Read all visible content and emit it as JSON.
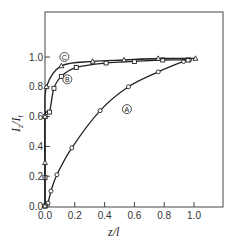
{
  "chart_data": {
    "type": "line",
    "title": "",
    "xlabel": "z/l",
    "ylabel": "I_z/I_t",
    "xlim": [
      0.0,
      1.2
    ],
    "ylim": [
      0.0,
      1.25
    ],
    "x_ticks": [
      "0.0",
      "0.2",
      "0.4",
      "0.6",
      "0.8",
      "1.0"
    ],
    "y_ticks": [
      "0.0",
      "0.2",
      "0.4",
      "0.6",
      "0.8",
      "1.0"
    ],
    "grid": false,
    "legend": "inline circled labels",
    "series": [
      {
        "name": "A",
        "marker": "circle",
        "points": [
          [
            0.0,
            0.0
          ],
          [
            0.02,
            0.02
          ],
          [
            0.04,
            0.1
          ],
          [
            0.08,
            0.21
          ],
          [
            0.18,
            0.39
          ],
          [
            0.37,
            0.64
          ],
          [
            0.56,
            0.8
          ],
          [
            0.76,
            0.9
          ],
          [
            0.93,
            0.97
          ],
          [
            0.97,
            0.98
          ]
        ]
      },
      {
        "name": "B",
        "marker": "square",
        "points": [
          [
            0.0,
            0.0
          ],
          [
            0.0,
            0.19
          ],
          [
            0.0,
            0.6
          ],
          [
            0.03,
            0.63
          ],
          [
            0.06,
            0.79
          ],
          [
            0.11,
            0.87
          ],
          [
            0.21,
            0.93
          ],
          [
            0.41,
            0.96
          ],
          [
            0.6,
            0.97
          ],
          [
            0.79,
            0.98
          ],
          [
            0.96,
            0.98
          ]
        ]
      },
      {
        "name": "C",
        "marker": "triangle",
        "points": [
          [
            0.0,
            0.0
          ],
          [
            0.0,
            0.29
          ],
          [
            0.0,
            0.6
          ],
          [
            0.01,
            0.8
          ],
          [
            0.11,
            0.94
          ],
          [
            0.32,
            0.97
          ],
          [
            0.53,
            0.98
          ],
          [
            0.76,
            0.99
          ],
          [
            1.01,
            0.99
          ]
        ]
      }
    ],
    "annotations": [
      {
        "text": "A",
        "x": 0.55,
        "y": 0.65
      },
      {
        "text": "B",
        "x": 0.15,
        "y": 0.85
      },
      {
        "text": "C",
        "x": 0.13,
        "y": 1.0
      }
    ]
  },
  "labels": {
    "xlabel": "z/l",
    "ylabel_main": "I",
    "ylabel_sub1": "z",
    "ylabel_sep": "/",
    "ylabel_sub2": "t"
  }
}
